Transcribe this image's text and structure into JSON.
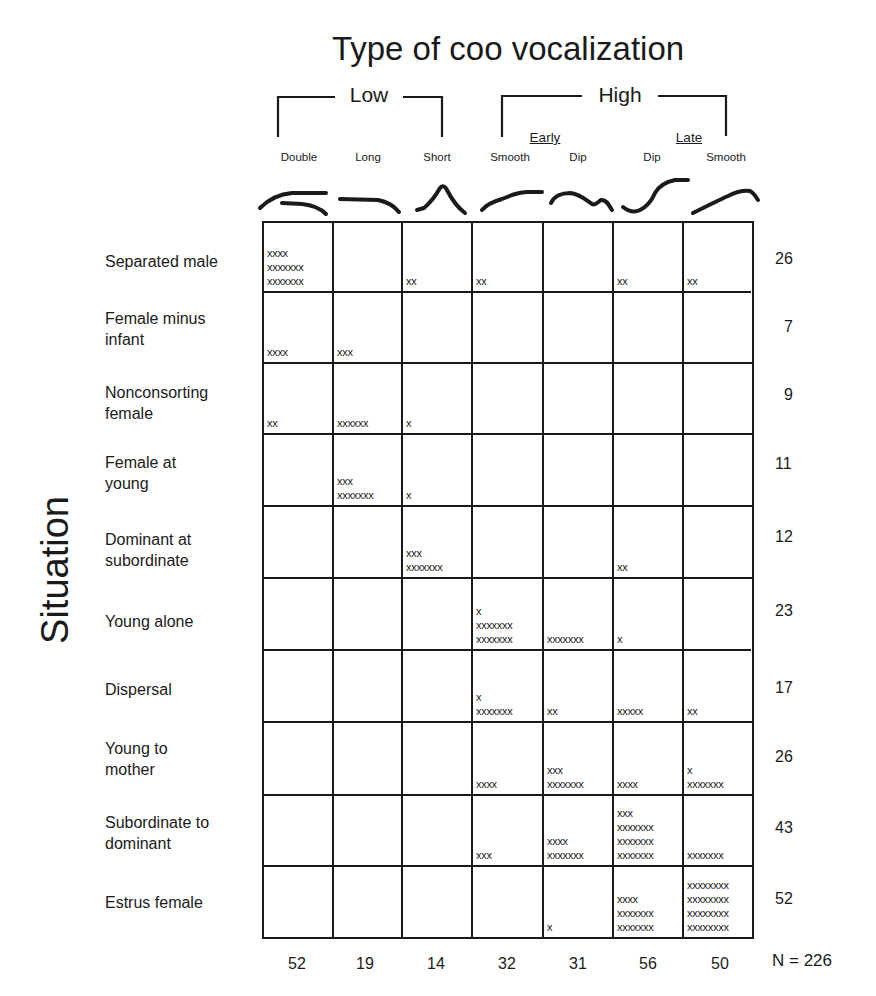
{
  "chart_data": {
    "type": "table",
    "title": "Type of coo vocalization",
    "ylabel": "Situation",
    "column_groups": [
      {
        "label": "Low",
        "columns": [
          "Double",
          "Long",
          "Short"
        ]
      },
      {
        "label": "High",
        "subgroups": [
          {
            "label": "Early",
            "columns": [
              "Smooth",
              "Dip"
            ]
          },
          {
            "label": "Late",
            "columns": [
              "Dip",
              "Smooth"
            ]
          }
        ]
      }
    ],
    "columns": [
      "Double",
      "Long",
      "Short",
      "Smooth",
      "Dip",
      "Dip",
      "Smooth"
    ],
    "column_full_names": [
      "Low Double",
      "Low Long",
      "Low Short",
      "High Early Smooth",
      "High Early Dip",
      "High Late Dip",
      "High Late Smooth"
    ],
    "rows": [
      "Separated male",
      "Female minus infant",
      "Nonconsorting female",
      "Female at young",
      "Dominant at subordinate",
      "Young alone",
      "Dispersal",
      "Young to mother",
      "Subordinate to dominant",
      "Estrus female"
    ],
    "row_totals": [
      26,
      7,
      9,
      11,
      12,
      23,
      17,
      26,
      43,
      52
    ],
    "column_totals": [
      52,
      19,
      14,
      32,
      31,
      56,
      50
    ],
    "N": 226,
    "counts_from_marks": [
      [
        18,
        0,
        2,
        2,
        0,
        2,
        2
      ],
      [
        4,
        3,
        0,
        0,
        0,
        0,
        0
      ],
      [
        2,
        6,
        1,
        0,
        0,
        0,
        0
      ],
      [
        0,
        10,
        1,
        0,
        0,
        0,
        0
      ],
      [
        0,
        0,
        10,
        0,
        0,
        2,
        0
      ],
      [
        0,
        0,
        0,
        15,
        7,
        1,
        0
      ],
      [
        0,
        0,
        0,
        8,
        2,
        5,
        2
      ],
      [
        0,
        0,
        0,
        4,
        10,
        4,
        8
      ],
      [
        0,
        0,
        0,
        3,
        11,
        24,
        7
      ],
      [
        0,
        0,
        0,
        0,
        1,
        18,
        32
      ]
    ],
    "cell_marks": [
      [
        "xxxx\nxxxxxxx\nxxxxxxx",
        "",
        "xx",
        "xx",
        "",
        "xx",
        "xx"
      ],
      [
        "xxxx",
        "xxx",
        "",
        "",
        "",
        "",
        ""
      ],
      [
        "xx",
        "xxxxxx",
        "x",
        "",
        "",
        "",
        ""
      ],
      [
        "",
        "xxx\nxxxxxxx",
        "x",
        "",
        "",
        "",
        ""
      ],
      [
        "",
        "",
        "xxx\nxxxxxxx",
        "",
        "",
        "xx",
        ""
      ],
      [
        "",
        "",
        "",
        "x\nxxxxxxx\nxxxxxxx",
        "xxxxxxx",
        "x",
        ""
      ],
      [
        "",
        "",
        "",
        "x\nxxxxxxx",
        "xx",
        "xxxxx",
        "xx"
      ],
      [
        "",
        "",
        "",
        "xxxx",
        "xxx\nxxxxxxx",
        "xxxx",
        "x\nxxxxxxx"
      ],
      [
        "",
        "",
        "",
        "xxx",
        "xxxx\nxxxxxxx",
        "xxx\nxxxxxxx\nxxxxxxx\nxxxxxxx",
        "xxxxxxx"
      ],
      [
        "",
        "",
        "",
        "",
        "x",
        "xxxx\nxxxxxxx\nxxxxxxx",
        "xxxxxxxx\nxxxxxxxx\nxxxxxxxx\nxxxxxxxx"
      ]
    ],
    "contour_icons": [
      "double-contour-icon",
      "long-contour-icon",
      "short-peak-contour-icon",
      "early-smooth-contour-icon",
      "early-dip-contour-icon",
      "late-dip-contour-icon",
      "late-smooth-contour-icon"
    ]
  },
  "labels": {
    "title": "Type of coo vocalization",
    "low": "Low",
    "high": "High",
    "early": "Early",
    "late": "Late",
    "situation": "Situation",
    "n_total": "N = 226",
    "row_label_lines": [
      "Separated male",
      "Female minus\ninfant",
      "Nonconsorting\nfemale",
      "Female at\nyoung",
      "Dominant at\nsubordinate",
      "Young alone",
      "Dispersal",
      "Young to\nmother",
      "Subordinate to\ndominant",
      "Estrus female"
    ]
  },
  "colors": {
    "ink": "#1a1a1a",
    "background": "#ffffff"
  }
}
